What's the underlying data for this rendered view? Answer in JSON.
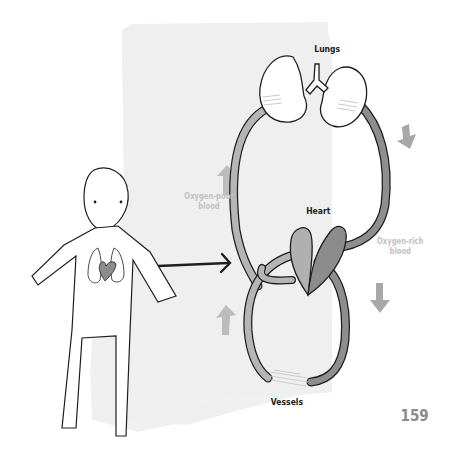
{
  "diagram": {
    "labels": {
      "lungs": "Lungs",
      "heart": "Heart",
      "vessels": "Vessels",
      "oxygen_poor": [
        "Oxygen-poor",
        "blood"
      ],
      "oxygen_rich": [
        "Oxygen-rich",
        "blood"
      ]
    },
    "page_number": "159",
    "colors": {
      "background_panel": "#efefef",
      "outline": "#1e1e1e",
      "vessel_oxygen_poor": "#b5b5b5",
      "vessel_oxygen_rich": "#8e8e8e",
      "heart_left": "#b0b0b0",
      "heart_right": "#8c8c8c",
      "flow_arrow": "#b8b8b8",
      "label_light": "#c2c2c2",
      "page_number": "#8a8a8a"
    },
    "icons": {
      "person": "person-figure-icon",
      "body_lungs": "lungs-icon",
      "body_heart": "heart-icon",
      "pointer_arrow": "arrow-right-icon",
      "flow_up": "arrow-up-icon",
      "flow_down": "arrow-down-icon"
    }
  }
}
